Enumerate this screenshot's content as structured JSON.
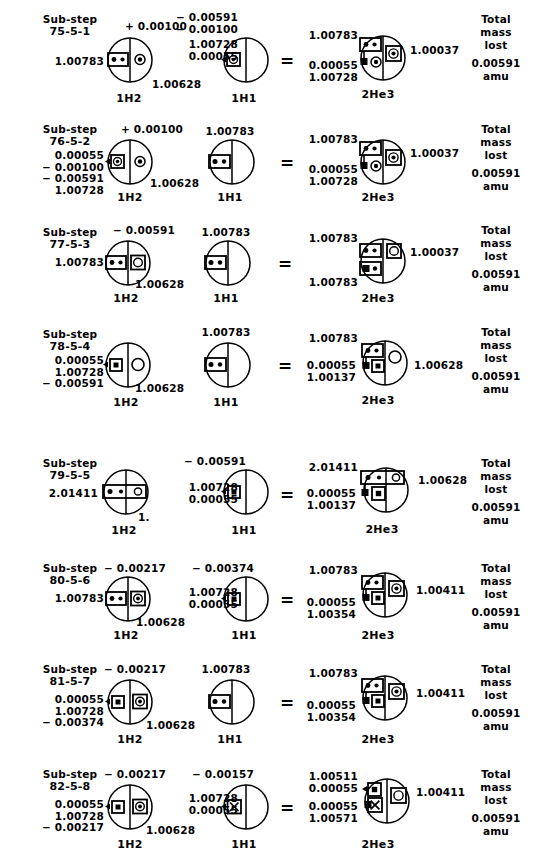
{
  "document": {
    "title": "Fusion sub-step mass balance diagrams",
    "element_left": "1H2",
    "element_mid": "1H1",
    "element_right": "2He3",
    "equals": "=",
    "total_label_line1": "Total",
    "total_label_line2": "mass",
    "total_label_line3": "lost",
    "unit": "amu",
    "ink": "#000000",
    "paper": "#ffffff"
  },
  "rows": [
    {
      "substep_word": "Sub-step",
      "substep_id": "75-5-1",
      "left": {
        "element": "1H2",
        "top": "+ 0.00100",
        "west": "1.00783",
        "southeast": "1.00628",
        "stack": []
      },
      "mid": {
        "element": "1H1",
        "top": "− 0.00591\n− 0.00100",
        "stack": "1.00728\n0.00055",
        "west": ""
      },
      "right": {
        "element": "2He3",
        "northwest": "1.00783",
        "southwest": "0.00055\n1.00728",
        "east": "1.00037"
      },
      "total": "0.00591"
    },
    {
      "substep_word": "Sub-step",
      "substep_id": "76-5-2",
      "left": {
        "element": "1H2",
        "top": "+ 0.00100",
        "west": "0.00055\n− 0.00100\n− 0.00591\n1.00728",
        "southeast": "1.00628",
        "stack": []
      },
      "mid": {
        "element": "1H1",
        "top": "1.00783",
        "stack": "",
        "west": ""
      },
      "right": {
        "element": "2He3",
        "northwest": "1.00783",
        "southwest": "0.00055\n1.00728",
        "east": "1.00037"
      },
      "total": "0.00591"
    },
    {
      "substep_word": "Sub-step",
      "substep_id": "77-5-3",
      "left": {
        "element": "1H2",
        "top": "− 0.00591",
        "west": "1.00783",
        "southeast": "1.00628",
        "stack": []
      },
      "mid": {
        "element": "1H1",
        "top": "1.00783",
        "stack": "",
        "west": ""
      },
      "right": {
        "element": "2He3",
        "northwest": "1.00783",
        "southwest": "1.00783",
        "east": "1.00037"
      },
      "total": "0.00591"
    },
    {
      "substep_word": "Sub-step",
      "substep_id": "78-5-4",
      "left": {
        "element": "1H2",
        "top": "",
        "west": "0.00055\n1.00728\n− 0.00591",
        "southeast": "1.00628",
        "stack": []
      },
      "mid": {
        "element": "1H1",
        "top": "1.00783",
        "stack": "",
        "west": ""
      },
      "right": {
        "element": "2He3",
        "northwest": "1.00783",
        "southwest": "0.00055\n1.00137",
        "east": "1.00628"
      },
      "total": "0.00591"
    },
    {
      "substep_word": "Sub-step",
      "substep_id": "79-5-5",
      "left": {
        "element": "1H2",
        "top": "",
        "west": "2.01411",
        "southeast": "1.",
        "stack": []
      },
      "mid": {
        "element": "1H1",
        "top": "− 0.00591",
        "stack": "1.00728\n0.00055",
        "west": ""
      },
      "right": {
        "element": "2He3",
        "northwest": "2.01411",
        "southwest": "0.00055\n1.00137",
        "east": "1.00628"
      },
      "total": "0.00591"
    },
    {
      "substep_word": "Sub-step",
      "substep_id": "80-5-6",
      "left": {
        "element": "1H2",
        "top": "− 0.00217",
        "west": "1.00783",
        "southeast": "1.00628",
        "stack": []
      },
      "mid": {
        "element": "1H1",
        "top": "− 0.00374",
        "stack": "1.00728\n0.00055",
        "west": ""
      },
      "right": {
        "element": "2He3",
        "northwest": "1.00783",
        "southwest": "0.00055\n1.00354",
        "east": "1.00411"
      },
      "total": "0.00591"
    },
    {
      "substep_word": "Sub-step",
      "substep_id": "81-5-7",
      "left": {
        "element": "1H2",
        "top": "− 0.00217",
        "west": "0.00055\n1.00728\n− 0.00374",
        "southeast": "1.00628",
        "stack": []
      },
      "mid": {
        "element": "1H1",
        "top": "1.00783",
        "stack": "",
        "west": ""
      },
      "right": {
        "element": "2He3",
        "northwest": "1.00783",
        "southwest": "0.00055\n1.00354",
        "east": "1.00411"
      },
      "total": "0.00591"
    },
    {
      "substep_word": "Sub-step",
      "substep_id": "82-5-8",
      "left": {
        "element": "1H2",
        "top": "− 0.00217",
        "west": "0.00055\n1.00728\n− 0.00217",
        "southeast": "1.00628",
        "stack": []
      },
      "mid": {
        "element": "1H1",
        "top": "− 0.00157",
        "stack": "1.00728\n0.00055",
        "west": ""
      },
      "right": {
        "element": "2He3",
        "northwest": "1.00511\n0.00055",
        "southwest": "0.00055\n1.00571",
        "east": "1.00411"
      },
      "total": "0.00591"
    }
  ]
}
